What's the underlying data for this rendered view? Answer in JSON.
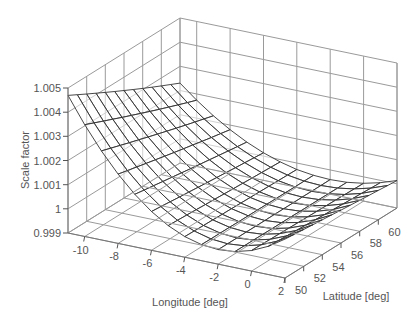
{
  "chart_data": {
    "type": "surface",
    "title": "",
    "xlabel": "Longitude [deg]",
    "ylabel": "Latitude [deg]",
    "zlabel": "Scale factor",
    "xlim": [
      -11,
      2
    ],
    "ylim": [
      50,
      62
    ],
    "zlim": [
      0.999,
      1.005
    ],
    "x_ticks": [
      -10,
      -8,
      -6,
      -4,
      -2,
      0,
      2
    ],
    "y_ticks": [
      50,
      52,
      54,
      56,
      58,
      60
    ],
    "z_ticks": [
      0.999,
      1,
      1.001,
      1.002,
      1.003,
      1.004,
      1.005
    ],
    "z_tick_labels": [
      "0.999",
      "1",
      "1.001",
      "1.002",
      "1.003",
      "1.004",
      "1.005"
    ],
    "x_tick_labels": [
      "-10",
      "-8",
      "-6",
      "-4",
      "-2",
      "0",
      "2"
    ],
    "y_tick_labels": [
      "50",
      "52",
      "54",
      "56",
      "58",
      "60"
    ],
    "grid": true,
    "surface": {
      "description": "Transverse Mercator scale factor over British Isles region; minimum ~0.9996 near central meridian -2 deg, rising to ~1.005 at -11 deg",
      "x": [
        -11,
        -10,
        -9,
        -8,
        -7,
        -6,
        -5,
        -4,
        -3,
        -2,
        -1,
        0,
        1,
        2
      ],
      "y": [
        50,
        51,
        52,
        53,
        54,
        55,
        56,
        57,
        58,
        59,
        60,
        61,
        62
      ],
      "central_meridian": -2,
      "k0": 0.9996013,
      "z_min": 0.9996,
      "z_max": 1.0049
    }
  }
}
